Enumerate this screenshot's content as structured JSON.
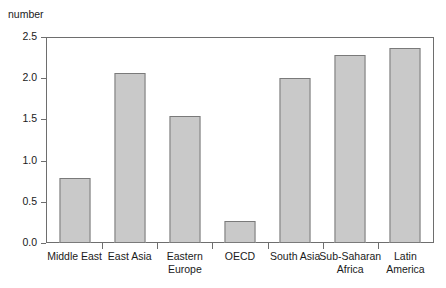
{
  "chart_data": {
    "type": "bar",
    "title": "",
    "subtitle": "",
    "xlabel": "",
    "ylabel": "number",
    "ylim": [
      0.0,
      2.5
    ],
    "grid": false,
    "legend": null,
    "ytick_labels": [
      "0.0",
      "0.5",
      "1.0",
      "1.5",
      "2.0",
      "2.5"
    ],
    "ytick_values": [
      0.0,
      0.5,
      1.0,
      1.5,
      2.0,
      2.5
    ],
    "categories": [
      "Middle East",
      "East Asia",
      "Eastern Europe",
      "OECD",
      "South Asia",
      "Sub-Saharan Africa",
      "Latin America"
    ],
    "category_lines": [
      [
        "Middle East"
      ],
      [
        "East Asia"
      ],
      [
        "Eastern",
        "Europe"
      ],
      [
        "OECD"
      ],
      [
        "South Asia"
      ],
      [
        "Sub-Saharan",
        "Africa"
      ],
      [
        "Latin",
        "America"
      ]
    ],
    "values": [
      0.8,
      2.08,
      1.56,
      0.27,
      2.02,
      2.31,
      2.39
    ],
    "colors": {
      "bar_fill": "#c9c9c9",
      "bar_border": "#7a7a7a",
      "axis": "#6e6e6e",
      "text": "#1a1a1a",
      "background": "#ffffff"
    }
  }
}
